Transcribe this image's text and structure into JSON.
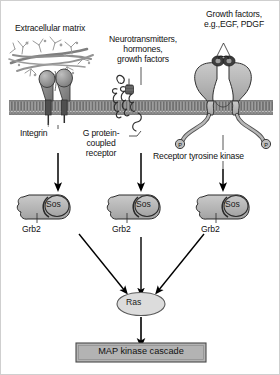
{
  "figure": {
    "background_color": "#ffffff"
  },
  "colors": {
    "membrane_fill": "#9a9a9a",
    "membrane_stroke": "#4a4a4a",
    "protein_fill": "#b9b9b9",
    "protein_stroke": "#2b2b2b",
    "integrin_fill": "#8a8a8a",
    "ecm_fiber": "#8e8e8e",
    "ras_fill": "#d8d8d8",
    "mapk_box_fill": "#b0b0b0",
    "arrow": "#000000",
    "text": "#111111"
  },
  "labels": {
    "extracellular_matrix": "Extracellular matrix",
    "neurotransmitters": "Neurotransmitters,\nhormones,\ngrowth factors",
    "growth_factors": "Growth factors,\ne.g.,EGF, PDGF",
    "integrin": "Integrin",
    "gpcr": "G protein-\ncoupled\nreceptor",
    "receptor_tyrosine_kinase": "Receptor tyrosine kinase",
    "phosphate": "P"
  },
  "adaptors": [
    {
      "grb2": "Grb2",
      "sos": "Sos"
    },
    {
      "grb2": "Grb2",
      "sos": "Sos"
    },
    {
      "grb2": "Grb2",
      "sos": "Sos"
    }
  ],
  "downstream": {
    "ras": "Ras",
    "map_kinase_cascade": "MAP kinase cascade"
  },
  "pathways": [
    {
      "receptor": "Integrin",
      "ligand": "Extracellular matrix",
      "adaptor": "Grb2/Sos",
      "target": "Ras"
    },
    {
      "receptor": "G protein-coupled receptor",
      "ligand": "Neurotransmitters, hormones, growth factors",
      "adaptor": "Grb2/Sos",
      "target": "Ras"
    },
    {
      "receptor": "Receptor tyrosine kinase",
      "ligand": "Growth factors, e.g.,EGF, PDGF",
      "adaptor": "Grb2/Sos",
      "target": "Ras"
    }
  ]
}
